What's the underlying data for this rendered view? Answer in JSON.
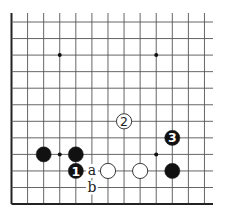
{
  "diagram": {
    "type": "go-board-fragment",
    "columns": 13,
    "rows": 12,
    "x0": 11.5,
    "y0": 22,
    "spacing_x": 16.08,
    "spacing_y": 16.55,
    "grid_top": 13,
    "grid_right": 213,
    "edges": [
      "left",
      "bottom"
    ],
    "colors": {
      "line": "#555555",
      "edge": "#222222",
      "black_stone": "#111111",
      "white_stone": "#ffffff",
      "background": "#ffffff"
    },
    "star_points": [
      {
        "col": 3,
        "row": 2
      },
      {
        "col": 9,
        "row": 2
      },
      {
        "col": 3,
        "row": 8
      },
      {
        "col": 9,
        "row": 8
      }
    ],
    "stones": [
      {
        "color": "black",
        "col": 2,
        "row": 8,
        "label": ""
      },
      {
        "color": "black",
        "col": 4,
        "row": 8,
        "label": ""
      },
      {
        "color": "black",
        "col": 4,
        "row": 9,
        "label": "1"
      },
      {
        "color": "white",
        "col": 6,
        "row": 9,
        "label": ""
      },
      {
        "color": "white",
        "col": 8,
        "row": 9,
        "label": ""
      },
      {
        "color": "black",
        "col": 10,
        "row": 9,
        "label": ""
      },
      {
        "color": "white",
        "col": 7,
        "row": 6,
        "label": "2"
      },
      {
        "color": "black",
        "col": 10,
        "row": 7,
        "label": "3"
      }
    ],
    "letters": [
      {
        "text": "a",
        "col": 5,
        "row": 9
      },
      {
        "text": "b",
        "col": 5,
        "row": 10
      }
    ]
  }
}
